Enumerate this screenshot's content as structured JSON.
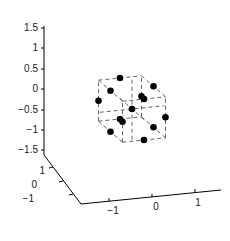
{
  "chart_data": {
    "type": "scatter3d",
    "title": "",
    "xlabel": "",
    "ylabel": "",
    "zlabel": "",
    "xlim": [
      -1.5,
      1.5
    ],
    "ylim": [
      -1.5,
      1.5
    ],
    "zlim": [
      -1.5,
      1.5
    ],
    "x_ticks": [
      "-1",
      "0",
      "1"
    ],
    "y_ticks": [
      "-1",
      "0",
      "1"
    ],
    "z_ticks": [
      "-1.5",
      "-1",
      "-0.5",
      "0",
      "0.5",
      "1",
      "1.5"
    ],
    "grid": false,
    "box": {
      "corners": [
        [
          -1,
          -1,
          -1
        ],
        [
          1,
          1,
          1
        ]
      ],
      "style": "dashed",
      "color": "#666666"
    },
    "center_lines": {
      "style": "dashed",
      "color": "#666666"
    },
    "marker": {
      "shape": "filled-circle",
      "color": "#000000"
    },
    "points": [
      {
        "x": 0,
        "y": 0,
        "z": 0
      },
      {
        "x": 0,
        "y": 1,
        "z": 1
      },
      {
        "x": 0,
        "y": -1,
        "z": 1
      },
      {
        "x": 1,
        "y": 0,
        "z": 1
      },
      {
        "x": -1,
        "y": 0,
        "z": 1
      },
      {
        "x": 0,
        "y": 1,
        "z": -1
      },
      {
        "x": 0,
        "y": -1,
        "z": -1
      },
      {
        "x": 1,
        "y": 0,
        "z": -1
      },
      {
        "x": -1,
        "y": 0,
        "z": -1
      },
      {
        "x": 1,
        "y": 1,
        "z": 0
      },
      {
        "x": 1,
        "y": -1,
        "z": 0
      },
      {
        "x": -1,
        "y": 1,
        "z": 0
      },
      {
        "x": -1,
        "y": -1,
        "z": 0
      }
    ]
  },
  "axes": {
    "z_ticks": [
      {
        "label": "1.5",
        "y": 28
      },
      {
        "label": "1",
        "y": 48
      },
      {
        "label": "0.5",
        "y": 69
      },
      {
        "label": "0",
        "y": 89
      },
      {
        "label": "−0.5",
        "y": 110
      },
      {
        "label": "−1",
        "y": 130
      },
      {
        "label": "−1.5",
        "y": 150
      }
    ],
    "y_ticks": [
      {
        "label": "1",
        "x": 42,
        "y": 174
      },
      {
        "label": "0",
        "x": 34,
        "y": 187
      },
      {
        "label": "−1",
        "x": 26,
        "y": 201
      }
    ],
    "x_ticks": [
      {
        "label": "−1",
        "x": 113,
        "y": 214
      },
      {
        "label": "0",
        "x": 156,
        "y": 210
      },
      {
        "label": "1",
        "x": 198,
        "y": 206
      }
    ]
  }
}
